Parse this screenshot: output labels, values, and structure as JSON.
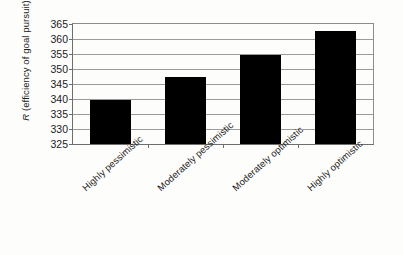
{
  "chart_data": {
    "type": "bar",
    "title": "",
    "xlabel": "",
    "ylabel": "R (efficiency of goal pursuit)",
    "ylabel_italic_prefix": "R",
    "ylabel_rest": " (efficiency of goal pursuit)",
    "categories": [
      "Highly pessimistic",
      "Moderately pessimistic",
      "Moderately optimistic",
      "Highly optimistic"
    ],
    "values": [
      339.8,
      347.2,
      354.8,
      362.7
    ],
    "ylim": [
      325,
      365
    ],
    "ytick_labels": [
      "325",
      "330",
      "335",
      "340",
      "345",
      "350",
      "355",
      "360",
      "365"
    ],
    "ytick_values": [
      325,
      330,
      335,
      340,
      345,
      350,
      355,
      360,
      365
    ],
    "grid": true,
    "legend": false,
    "bar_color": "#000000",
    "grid_color": "#9a9a9a",
    "axis_color": "#6e6e6e",
    "background_color": "#fdfdfb"
  }
}
